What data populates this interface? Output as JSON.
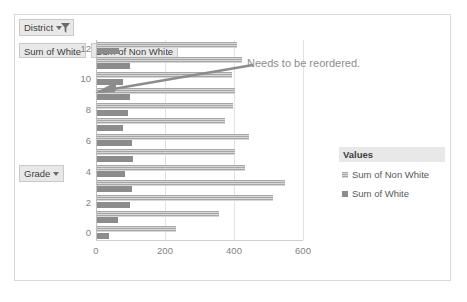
{
  "pivot": {
    "district_filter_label": "District",
    "grade_field_label": "Grade",
    "value_fields": [
      "Sum of White",
      "Sum of Non White"
    ],
    "icons": {
      "filter": "funnel-icon",
      "dropdown": "chevron-down-icon"
    }
  },
  "annotation": {
    "text": "Needs to be reordered."
  },
  "legend": {
    "title": "Values",
    "items": [
      {
        "label": "Sum of Non White",
        "series": "nonwhite"
      },
      {
        "label": "Sum of White",
        "series": "white"
      }
    ]
  },
  "chart_data": {
    "type": "bar",
    "orientation": "horizontal",
    "title": "",
    "xlabel": "",
    "ylabel": "Grade",
    "xlim": [
      0,
      600
    ],
    "ylim": [
      -0.5,
      12.5
    ],
    "xticks": [
      0,
      200,
      400,
      600
    ],
    "yticks": [
      0,
      2,
      4,
      6,
      8,
      10,
      12
    ],
    "grid": true,
    "legend_position": "right",
    "categories": [
      0,
      1,
      2,
      3,
      4,
      5,
      6,
      7,
      8,
      9,
      10,
      11,
      12
    ],
    "series": [
      {
        "name": "Sum of Non White",
        "values": [
          230,
          355,
          510,
          545,
          430,
          400,
          440,
          370,
          395,
          400,
          390,
          420,
          405
        ]
      },
      {
        "name": "Sum of White",
        "values": [
          35,
          60,
          95,
          100,
          80,
          105,
          100,
          75,
          90,
          95,
          75,
          95,
          65
        ]
      }
    ],
    "colors": {
      "non_white": "#a6a6a6",
      "white": "#8c8c8c"
    }
  }
}
